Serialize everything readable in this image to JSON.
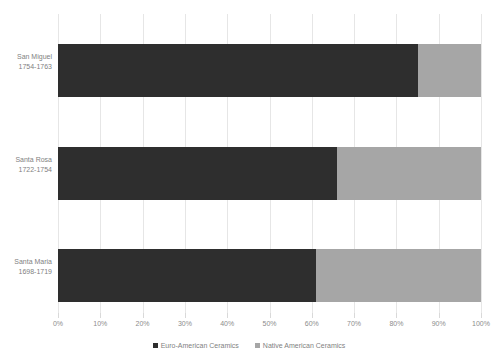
{
  "chart_data": {
    "type": "bar",
    "orientation": "horizontal",
    "stacked": true,
    "normalized": true,
    "title": "",
    "xlabel": "",
    "ylabel": "",
    "xlim": [
      0,
      100
    ],
    "grid": true,
    "legend_position": "bottom",
    "categories": [
      {
        "name": "San Miguel",
        "period": "1754-1763"
      },
      {
        "name": "Santa Rosa",
        "period": "1722-1754"
      },
      {
        "name": "Santa Maria",
        "period": "1698-1719"
      }
    ],
    "xticks": [
      "0%",
      "10%",
      "20%",
      "30%",
      "40%",
      "50%",
      "60%",
      "70%",
      "80%",
      "90%",
      "100%"
    ],
    "xtick_values": [
      0,
      10,
      20,
      30,
      40,
      50,
      60,
      70,
      80,
      90,
      100
    ],
    "series": [
      {
        "name": "Euro-American Ceramics",
        "color": "#2e2e2e",
        "values": [
          85,
          66,
          61
        ]
      },
      {
        "name": "Native American Ceramics",
        "color": "#a6a6a6",
        "values": [
          15,
          34,
          39
        ]
      }
    ],
    "colors": {
      "gridline": "#e6e6e6",
      "text": "#7f7f7f",
      "background": "#ffffff"
    }
  }
}
